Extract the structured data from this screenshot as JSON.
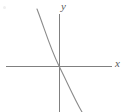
{
  "figure": {
    "width": 125,
    "height": 112,
    "background_color": "#ffffff"
  },
  "axes": {
    "color": "#808080",
    "stroke_width": 1,
    "origin": {
      "x": 59,
      "y": 66
    },
    "x_axis": {
      "name": "x-axis",
      "x1": 6,
      "y1": 66,
      "x2": 112,
      "y2": 66
    },
    "y_axis": {
      "name": "y-axis",
      "x1": 59,
      "y1": 14,
      "x2": 59,
      "y2": 112
    },
    "x_label": "x",
    "y_label": "y",
    "label_color": "#5a5a5a"
  },
  "curve": {
    "name": "decreasing-odd-curve",
    "color": "#8a8a8a",
    "stroke_width": 1.1,
    "description": "Monotonically decreasing curve, symmetric about the origin, steep at both ends and flat at the inflection point",
    "path": "M 37 9 C 44 27, 50 48, 59 66 C 68 84, 75 100, 82 112"
  },
  "artifacts": {
    "corner_speck": "scan-speck"
  },
  "chart_data": {
    "type": "line",
    "title": "",
    "xlabel": "x",
    "ylabel": "y",
    "grid": false,
    "legend": null,
    "xlim": [
      -53,
      53
    ],
    "ylim": [
      -46,
      57
    ],
    "series": [
      {
        "name": "decreasing odd function",
        "comment": "Graph coordinates in axis units relative to the origin at pixel (59,66); y increases upward.",
        "x": [
          -22,
          -20,
          -18,
          -16,
          -14,
          -12,
          -10,
          -8,
          -6,
          -4,
          -2,
          0,
          2,
          4,
          6,
          8,
          10,
          12,
          14,
          16,
          18,
          20,
          23
        ],
        "y": [
          57,
          49,
          42,
          36,
          30,
          25,
          20,
          16,
          11,
          7,
          4,
          0,
          -4,
          -7,
          -11,
          -16,
          -20,
          -25,
          -30,
          -36,
          -42,
          -49,
          -46
        ]
      }
    ]
  }
}
